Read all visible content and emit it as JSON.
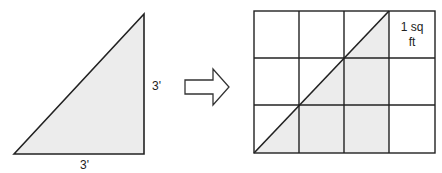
{
  "diagram": {
    "left_triangle": {
      "side_label_vertical": "3'",
      "side_label_horizontal": "3'",
      "fill": "#ececec",
      "stroke": "#222222"
    },
    "arrow": {
      "direction": "right",
      "fill": "#ffffff",
      "stroke": "#333333"
    },
    "grid": {
      "columns": 4,
      "rows": 3,
      "cell_label_line1": "1 sq",
      "cell_label_line2": "ft",
      "shaded_fill": "#ececec",
      "stroke": "#222222"
    }
  }
}
